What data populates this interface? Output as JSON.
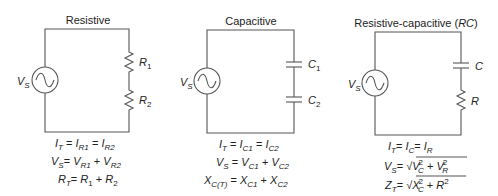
{
  "circuits": [
    {
      "title": "Resistive",
      "source": {
        "label": "V",
        "sub": "S"
      },
      "components": [
        {
          "type": "resistor",
          "label": "R",
          "sub": "1"
        },
        {
          "type": "resistor",
          "label": "R",
          "sub": "2"
        }
      ],
      "equations": [
        "I_T = I_R1 = I_R2",
        "V_S = V_R1 + V_R2",
        "R_T = R_1 + R_2"
      ]
    },
    {
      "title": "Capacitive",
      "source": {
        "label": "V",
        "sub": "S"
      },
      "components": [
        {
          "type": "capacitor",
          "label": "C",
          "sub": "1"
        },
        {
          "type": "capacitor",
          "label": "C",
          "sub": "2"
        }
      ],
      "equations": [
        "I_T = I_C1 = I_C2",
        "V_S = V_C1 + V_C2",
        "X_C(T) = X_C1 + X_C2"
      ]
    },
    {
      "title": "Resistive-capacitive (",
      "title_italic": "RC",
      "title_end": ")",
      "source": {
        "label": "V",
        "sub": "S"
      },
      "components": [
        {
          "type": "capacitor",
          "label": "C",
          "sub": ""
        },
        {
          "type": "resistor",
          "label": "R",
          "sub": ""
        }
      ],
      "equations": [
        "I_T = I_C = I_R",
        "V_S = sqrt(V_C^2 + V_R^2)",
        "Z_T = sqrt(X_C^2 + R^2)"
      ]
    }
  ],
  "text": {
    "eq": "=",
    "plus": "+",
    "I": "I",
    "V": "V",
    "R": "R",
    "X": "X",
    "Z": "Z",
    "C": "C",
    "T": "T",
    "S": "S",
    "R1": "R1",
    "R2": "R2",
    "C1": "C1",
    "C2": "C2",
    "CT": "C(T)",
    "one": "1",
    "two": "2",
    "sq": "2",
    "sqrt": "√"
  }
}
